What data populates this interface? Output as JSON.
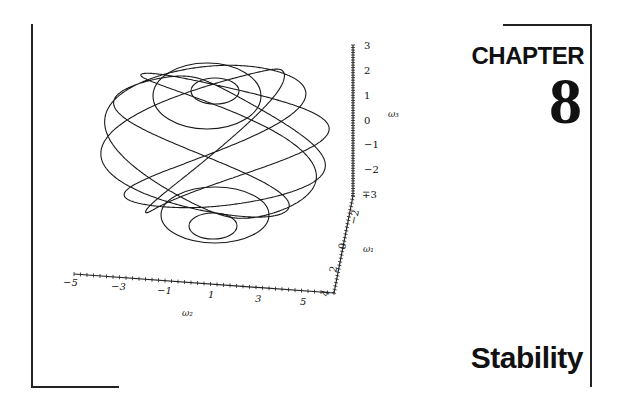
{
  "page": {
    "chapter_label": "CHAPTER",
    "chapter_number": "8",
    "chapter_title": "Stability"
  },
  "figure": {
    "axes": {
      "w3": {
        "label": "ω₃",
        "ticks": [
          "3",
          "2",
          "1",
          "0",
          "−1",
          "−2",
          "∓3"
        ],
        "range": [
          -3,
          3
        ]
      },
      "w1": {
        "label": "ω₁",
        "ticks": [
          "−2",
          "0",
          "2",
          "4"
        ],
        "range": [
          -3,
          4
        ]
      },
      "w2": {
        "label": "ω₂",
        "ticks": [
          "−5",
          "−3",
          "−1",
          "1",
          "3",
          "5"
        ],
        "range": [
          -5,
          5
        ]
      }
    }
  }
}
